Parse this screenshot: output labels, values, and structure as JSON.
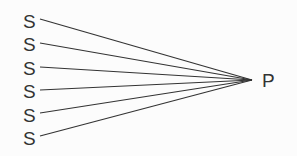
{
  "diagram": {
    "sources": [
      {
        "label": "S",
        "x": 23,
        "y": 12,
        "lx": 40,
        "ly": 19
      },
      {
        "label": "S",
        "x": 23,
        "y": 35,
        "lx": 40,
        "ly": 43
      },
      {
        "label": "S",
        "x": 23,
        "y": 59,
        "lx": 40,
        "ly": 67
      },
      {
        "label": "S",
        "x": 23,
        "y": 82,
        "lx": 40,
        "ly": 90
      },
      {
        "label": "S",
        "x": 23,
        "y": 106,
        "lx": 40,
        "ly": 113
      },
      {
        "label": "S",
        "x": 23,
        "y": 129,
        "lx": 40,
        "ly": 136
      }
    ],
    "target": {
      "label": "P",
      "x": 262,
      "y": 71,
      "px": 252,
      "py": 80
    },
    "line_color": "#333333"
  }
}
